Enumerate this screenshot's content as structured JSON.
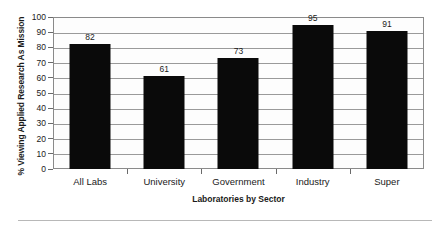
{
  "chart_data": {
    "type": "bar",
    "title": "",
    "subtitle": "",
    "xlabel": "Laboratories by Sector",
    "ylabel": "% Viewing Applied Research As Mission",
    "categories": [
      "All Labs",
      "University",
      "Government",
      "Industry",
      "Super"
    ],
    "values": [
      82,
      61,
      73,
      95,
      91
    ],
    "data_labels": [
      "82",
      "61",
      "73",
      "95",
      "91"
    ],
    "ylim": [
      0,
      100
    ],
    "ytick_labels": [
      "100",
      "90",
      "80",
      "70",
      "60",
      "50",
      "40",
      "30",
      "20",
      "10",
      "0"
    ],
    "ytick_values": [
      100,
      90,
      80,
      70,
      60,
      50,
      40,
      30,
      20,
      10,
      0
    ],
    "grid": true,
    "grid_axis": "y",
    "legend": "none",
    "bar_color": "#0a0a0a",
    "grid_color": "#9a9a9a",
    "frame_color": "#8a8a8a",
    "plot_background": "#fdfdfd"
  }
}
